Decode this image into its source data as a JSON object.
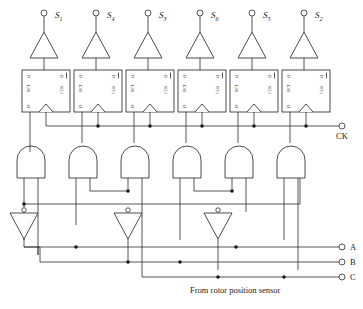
{
  "diagram": {
    "caption": "From rotor position sensor",
    "clock_label": "CK",
    "colors": {
      "line": "#2b2b2b",
      "text": "#1a1a1a",
      "background": "#ffffff"
    },
    "outputs_top": [
      {
        "id": "s1",
        "label": "S",
        "sub": "1",
        "terminal": "open-circle"
      },
      {
        "id": "s4",
        "label": "S",
        "sub": "4",
        "terminal": "open-circle"
      },
      {
        "id": "s3",
        "label": "S",
        "sub": "3",
        "terminal": "open-circle"
      },
      {
        "id": "s6",
        "label": "S",
        "sub": "6",
        "terminal": "open-circle"
      },
      {
        "id": "s5",
        "label": "S",
        "sub": "5",
        "terminal": "open-circle"
      },
      {
        "id": "s2",
        "label": "S",
        "sub": "2",
        "terminal": "open-circle"
      }
    ],
    "flipflops": {
      "count": 6,
      "type": "D",
      "pin_q": "Q",
      "pin_qbar": "Q",
      "pin_set": "SET",
      "pin_clr": "CLR",
      "pin_d": "D",
      "clock_edge": "rising"
    },
    "and_gates": {
      "count": 6,
      "inputs": 2
    },
    "inverters": {
      "count": 3
    },
    "buffers": {
      "count": 6
    },
    "inputs_right": [
      {
        "id": "a",
        "label": "A",
        "terminal": "open-circle"
      },
      {
        "id": "b",
        "label": "B",
        "terminal": "open-circle"
      },
      {
        "id": "c",
        "label": "C",
        "terminal": "open-circle"
      }
    ]
  }
}
